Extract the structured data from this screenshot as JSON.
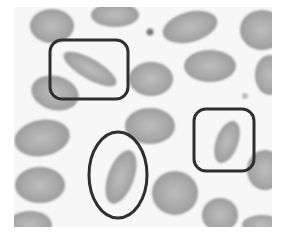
{
  "image": {
    "subject": "blood smear micrograph with elongated cells highlighted",
    "background": "#f7f7f7",
    "cell_color": "#a8a8a8",
    "cell_edge_color": "#8e8e8e",
    "annotation_color": "#2f2f2f"
  },
  "annotations": [
    {
      "shape": "rounded-rectangle",
      "label": "elongated-cell-top-left"
    },
    {
      "shape": "ellipse",
      "label": "elongated-cell-bottom-center"
    },
    {
      "shape": "rounded-rectangle",
      "label": "elongated-cell-right"
    }
  ]
}
